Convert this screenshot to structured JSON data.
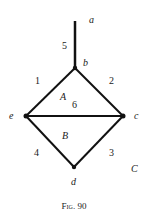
{
  "figure": {
    "caption": "Fig. 90",
    "nodes": [
      {
        "id": "a",
        "label": "a",
        "x": 75,
        "y": 21
      },
      {
        "id": "b",
        "label": "b",
        "x": 75,
        "y": 68
      },
      {
        "id": "e",
        "label": "e",
        "x": 26,
        "y": 116
      },
      {
        "id": "c",
        "label": "c",
        "x": 123,
        "y": 116
      },
      {
        "id": "d",
        "label": "d",
        "x": 74,
        "y": 167
      }
    ],
    "edges": [
      {
        "from": "a",
        "to": "b",
        "label": "5"
      },
      {
        "from": "b",
        "to": "e",
        "label": "1"
      },
      {
        "from": "b",
        "to": "c",
        "label": "2"
      },
      {
        "from": "e",
        "to": "c",
        "label": "6"
      },
      {
        "from": "e",
        "to": "d",
        "label": "4"
      },
      {
        "from": "c",
        "to": "d",
        "label": "3"
      }
    ],
    "regions": [
      {
        "label": "A"
      },
      {
        "label": "B"
      },
      {
        "label": "C"
      }
    ]
  }
}
